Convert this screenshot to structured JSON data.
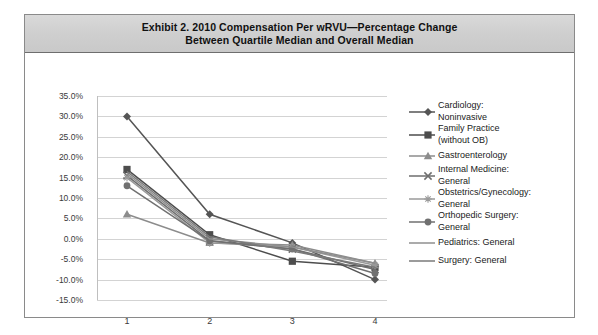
{
  "exhibit": {
    "title_line1": "Exhibit 2. 2010 Compensation Per wRVU—Percentage Change",
    "title_line2": "Between Quartile Median and Overall Median"
  },
  "chart_data": {
    "type": "line",
    "title": "Exhibit 2. 2010 Compensation Per wRVU—Percentage Change Between Quartile Median and Overall Median",
    "xlabel": "",
    "ylabel": "",
    "categories": [
      "1",
      "2",
      "3",
      "4"
    ],
    "ylim": [
      -15,
      35
    ],
    "ytick_step": 5,
    "yticks": [
      "35.0%",
      "30.0%",
      "25.0%",
      "20.0%",
      "15.0%",
      "10.0%",
      "5.0%",
      "0.0%",
      "-5.0%",
      "-10.0%",
      "-15.0%"
    ],
    "ytick_values": [
      35,
      30,
      25,
      20,
      15,
      10,
      5,
      0,
      -5,
      -10,
      -15
    ],
    "grid": true,
    "legend_position": "right",
    "series": [
      {
        "name": "Cardiology: Noninvasive",
        "marker": "diamond",
        "color": "#555555",
        "values": [
          30.0,
          6.0,
          -1.0,
          -10.0
        ]
      },
      {
        "name": "Family Practice (without OB)",
        "marker": "square",
        "color": "#4d4d4d",
        "values": [
          17.0,
          1.0,
          -5.5,
          -7.0
        ]
      },
      {
        "name": "Gastroenterology",
        "marker": "triangle",
        "color": "#8c8c8c",
        "values": [
          6.0,
          -1.0,
          -1.5,
          -6.0
        ]
      },
      {
        "name": "Internal Medicine: General",
        "marker": "cross",
        "color": "#6e6e6e",
        "values": [
          15.5,
          -0.5,
          -2.5,
          -7.5
        ]
      },
      {
        "name": "Obstetrics/Gynecology: General",
        "marker": "asterisk",
        "color": "#9a9a9a",
        "values": [
          15.0,
          -1.0,
          -2.0,
          -6.5
        ]
      },
      {
        "name": "Orthopedic Surgery: General",
        "marker": "circle",
        "color": "#707070",
        "values": [
          13.0,
          -0.5,
          -2.5,
          -8.5
        ]
      },
      {
        "name": "Pediatrics: General",
        "marker": "line",
        "color": "#8f8f8f",
        "values": [
          16.0,
          0.0,
          -2.0,
          -6.0
        ]
      },
      {
        "name": "Surgery: General",
        "marker": "line",
        "color": "#7a7a7a",
        "values": [
          16.5,
          0.5,
          -3.0,
          -7.0
        ]
      }
    ]
  },
  "legend": [
    {
      "label_line1": "Cardiology:",
      "label_line2": "Noninvasive",
      "marker": "diamond-marker-icon"
    },
    {
      "label_line1": "Family Practice",
      "label_line2": "(without OB)",
      "marker": "square-marker-icon"
    },
    {
      "label_line1": "Gastroenterology",
      "label_line2": "",
      "marker": "triangle-marker-icon"
    },
    {
      "label_line1": "Internal Medicine:",
      "label_line2": "General",
      "marker": "cross-marker-icon"
    },
    {
      "label_line1": "Obstetrics/Gynecology:",
      "label_line2": "General",
      "marker": "asterisk-marker-icon"
    },
    {
      "label_line1": "Orthopedic Surgery:",
      "label_line2": "General",
      "marker": "circle-marker-icon"
    },
    {
      "label_line1": "Pediatrics: General",
      "label_line2": "",
      "marker": "line-marker-icon"
    },
    {
      "label_line1": "Surgery: General",
      "label_line2": "",
      "marker": "line-marker-icon"
    }
  ],
  "colors": {
    "frame_border": "#8a8a8a",
    "titlebar": "#d2d2d2",
    "gridline": "#d3d3d3",
    "text": "#1a1a1a"
  }
}
